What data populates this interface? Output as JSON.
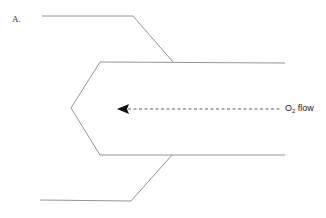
{
  "panel_label": "A.",
  "flow": {
    "species": "O",
    "subscript": "2",
    "suffix": " flow",
    "direction": "left"
  },
  "colors": {
    "line": "#888888",
    "arrow": "#111111",
    "text": "#222222"
  },
  "shapes": {
    "outer_top": "42,16 133,16 173,62",
    "inner_top": "173,62 285,63",
    "inner_chevron": "285,63 100,62 71,108 100,155 285,155",
    "outer_bottom": "40,200 131,201 172,155"
  }
}
